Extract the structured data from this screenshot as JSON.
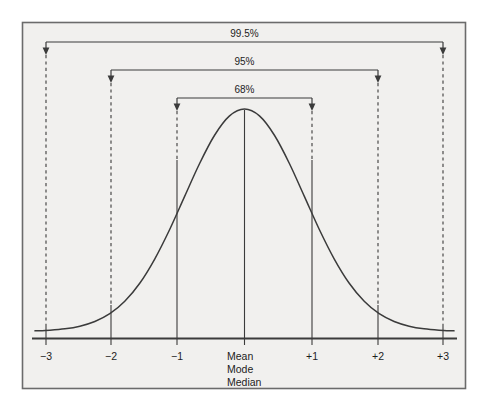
{
  "figure": {
    "background_color": "#f1f0ee",
    "border_color": "#6b6b6b",
    "curve_color": "#3b3b3b",
    "line_color": "#3b3b3b",
    "text_color": "#1d1d1d"
  },
  "brackets": [
    {
      "label": "99.5%",
      "from": -3,
      "to": 3
    },
    {
      "label": "95%",
      "from": -2,
      "to": 2
    },
    {
      "label": "68%",
      "from": -1,
      "to": 1
    }
  ],
  "axis": {
    "ticks": [
      {
        "label": "−3",
        "value": -3
      },
      {
        "label": "−2",
        "value": -2
      },
      {
        "label": "−1",
        "value": -1
      },
      {
        "label": "",
        "value": 0
      },
      {
        "label": "+1",
        "value": 1
      },
      {
        "label": "+2",
        "value": 2
      },
      {
        "label": "+3",
        "value": 3
      }
    ]
  },
  "center_labels": [
    "Mean",
    "Mode",
    "Median"
  ],
  "chart_data": {
    "type": "line",
    "title": "",
    "subtitle": "",
    "xlabel": "",
    "ylabel": "",
    "xlim": [
      -3.55,
      3.55
    ],
    "ylim": [
      0,
      1
    ],
    "grid": false,
    "legend_position": "none",
    "xticks": [
      -3,
      -2,
      -1,
      0,
      1,
      2,
      3
    ],
    "xticklabels": [
      "−3",
      "−2",
      "−1",
      "Mean / Mode / Median",
      "+1",
      "+2",
      "+3"
    ],
    "annotations": [
      {
        "text": "99.5%",
        "span": [
          -3,
          3
        ],
        "type": "bracket",
        "y_level": 3
      },
      {
        "text": "95%",
        "span": [
          -2,
          2
        ],
        "type": "bracket",
        "y_level": 2
      },
      {
        "text": "68%",
        "span": [
          -1,
          1
        ],
        "type": "bracket",
        "y_level": 1
      },
      {
        "text": "Mean",
        "at_x": 0,
        "type": "axis-label"
      },
      {
        "text": "Mode",
        "at_x": 0,
        "type": "axis-label"
      },
      {
        "text": "Median",
        "at_x": 0,
        "type": "axis-label"
      }
    ],
    "series": [
      {
        "name": "Standard normal density",
        "x": [
          -3.5,
          -3.25,
          -3,
          -2.75,
          -2.5,
          -2.25,
          -2,
          -1.75,
          -1.5,
          -1.25,
          -1,
          -0.75,
          -0.5,
          -0.25,
          0,
          0.25,
          0.5,
          0.75,
          1,
          1.25,
          1.5,
          1.75,
          2,
          2.25,
          2.5,
          2.75,
          3,
          3.25,
          3.5
        ],
        "y": [
          0.002,
          0.005,
          0.011,
          0.023,
          0.044,
          0.079,
          0.135,
          0.216,
          0.325,
          0.458,
          0.607,
          0.755,
          0.882,
          0.969,
          1.0,
          0.969,
          0.882,
          0.755,
          0.607,
          0.458,
          0.325,
          0.216,
          0.135,
          0.079,
          0.044,
          0.023,
          0.011,
          0.005,
          0.002
        ]
      }
    ],
    "sigma_proportions": {
      "within_1_sigma": "68%",
      "within_2_sigma": "95%",
      "within_3_sigma": "99.5%"
    }
  }
}
